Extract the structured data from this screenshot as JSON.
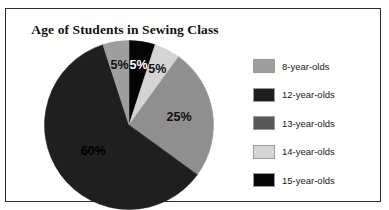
{
  "frame": {
    "border_color": "#2b2b2b",
    "background": "#ffffff"
  },
  "chart_data": {
    "type": "pie",
    "title": "Age of Students in Sewing Class",
    "xlabel": "",
    "ylabel": "",
    "legend_position": "right",
    "grid": false,
    "start_angle_deg": 0,
    "direction": "clockwise",
    "categories": [
      "15-year-olds",
      "14-year-olds",
      "13-year-olds",
      "12-year-olds",
      "8-year-olds"
    ],
    "values": [
      5,
      25,
      60,
      5,
      5
    ],
    "unit": "%",
    "slices": [
      {
        "label": "15-year-olds",
        "value": 5,
        "display": "5%",
        "color": "#050505",
        "label_color": "#ffffff",
        "start_deg": 0,
        "end_deg": 18
      },
      {
        "label": "14-year-olds",
        "value": 5,
        "display": "5%",
        "color": "#d4d4d4",
        "label_color": "#111111",
        "start_deg": 18,
        "end_deg": 36
      },
      {
        "label": "13-year-olds",
        "value": 25,
        "display": "25%",
        "color": "#8f8f8f",
        "label_color": "#111111",
        "start_deg": 36,
        "end_deg": 126
      },
      {
        "label": "12-year-olds",
        "value": 60,
        "display": "60%",
        "color": "#1f1f1f",
        "label_color": "#000000",
        "start_deg": 126,
        "end_deg": 342
      },
      {
        "label": "8-year-olds",
        "value": 5,
        "display": "5%",
        "color": "#9e9e9e",
        "label_color": "#111111",
        "start_deg": 342,
        "end_deg": 360
      }
    ],
    "legend": [
      {
        "label": "8-year-olds",
        "color": "#9e9e9e"
      },
      {
        "label": "12-year-olds",
        "color": "#1f1f1f"
      },
      {
        "label": "13-year-olds",
        "color": "#585858"
      },
      {
        "label": "14-year-olds",
        "color": "#d4d4d4"
      },
      {
        "label": "15-year-olds",
        "color": "#050505"
      }
    ]
  }
}
